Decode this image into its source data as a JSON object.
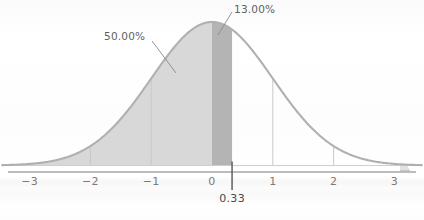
{
  "figure": {
    "background_color": "#fefefe",
    "curve_stroke_color": "#b0b0b0",
    "axis_color": "#b9b9b9",
    "gridline_color": "#c9c9c9",
    "marker_line_color": "#555555",
    "leader_line_color": "#8a8a8a",
    "tick_text_color": "#7b7b7b",
    "label_text_color": "#5f5f5f"
  },
  "axis": {
    "label": "",
    "tick_labels": [
      "−3",
      "−2",
      "−1",
      "0",
      "1",
      "2",
      "3"
    ],
    "tick_values": [
      -3,
      -2,
      -1,
      0,
      1,
      2,
      3
    ],
    "range": [
      -3.45,
      3.45
    ]
  },
  "marker": {
    "label": "0.33",
    "value": 0.33
  },
  "regions": [
    {
      "name": "left-area",
      "label": "50.00%",
      "value_pct": 50.0,
      "fill_color": "#d8d8d8",
      "z_from": -3.45,
      "z_to": 0
    },
    {
      "name": "highlight-area",
      "label": "13.00%",
      "value_pct": 13.0,
      "fill_color": "#b4b4b4",
      "z_from": 0,
      "z_to": 0.33
    }
  ],
  "chart_data": {
    "type": "area",
    "title": "",
    "subtitle": "",
    "xlabel": "",
    "ylabel": "",
    "distribution": "standard normal",
    "mean": 0,
    "stdev": 1,
    "xlim": [
      -3.45,
      3.45
    ],
    "ylim": [
      0,
      0.42
    ],
    "grid": false,
    "legend": null,
    "x_tick_labels": [
      "−3",
      "−2",
      "−1",
      "0",
      "1",
      "2",
      "3"
    ],
    "x_ticks": [
      -3,
      -2,
      -1,
      0,
      1,
      2,
      3
    ],
    "gridline_x_values": [
      -2,
      -1,
      1,
      2
    ],
    "shaded_regions": [
      {
        "label": "50.00%",
        "value_pct": 50.0,
        "from": -3.45,
        "to": 0,
        "color": "#d8d8d8"
      },
      {
        "label": "13.00%",
        "value_pct": 13.0,
        "from": 0,
        "to": 0.33,
        "color": "#b4b4b4"
      }
    ],
    "markers": [
      {
        "label": "0.33",
        "x": 0.33
      }
    ],
    "annotations": [
      {
        "text": "50.00%",
        "points_to_x": -0.55,
        "points_to_y": 0.32
      },
      {
        "text": "13.00%",
        "points_to_x": 0.16,
        "points_to_y": 0.385
      }
    ],
    "series": [
      {
        "name": "standard normal pdf",
        "x": [
          -3.45,
          -3.2,
          -3.0,
          -2.8,
          -2.6,
          -2.4,
          -2.2,
          -2.0,
          -1.8,
          -1.6,
          -1.4,
          -1.2,
          -1.0,
          -0.8,
          -0.6,
          -0.4,
          -0.2,
          0.0,
          0.2,
          0.33,
          0.4,
          0.6,
          0.8,
          1.0,
          1.2,
          1.4,
          1.6,
          1.8,
          2.0,
          2.2,
          2.4,
          2.6,
          2.8,
          3.0,
          3.2,
          3.45
        ],
        "values": [
          0.001,
          0.0024,
          0.0044,
          0.0079,
          0.0136,
          0.0224,
          0.0355,
          0.054,
          0.079,
          0.1109,
          0.1497,
          0.1942,
          0.242,
          0.2897,
          0.3332,
          0.3683,
          0.391,
          0.3989,
          0.391,
          0.3778,
          0.3683,
          0.3332,
          0.2897,
          0.242,
          0.1942,
          0.1497,
          0.1109,
          0.079,
          0.054,
          0.0355,
          0.0224,
          0.0136,
          0.0079,
          0.0044,
          0.0024,
          0.001
        ]
      }
    ]
  }
}
